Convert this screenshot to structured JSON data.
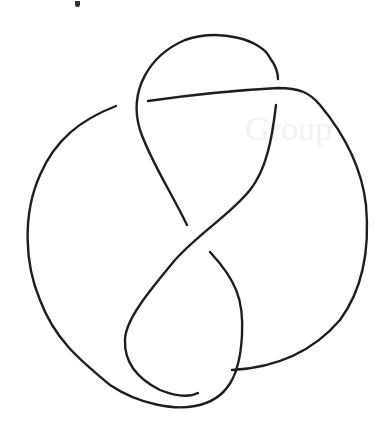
{
  "figure": {
    "type": "knot-diagram",
    "stroke_color": "#1e1e1e",
    "background": "#ffffff",
    "crossings": 4,
    "bleed_text": "Group"
  }
}
